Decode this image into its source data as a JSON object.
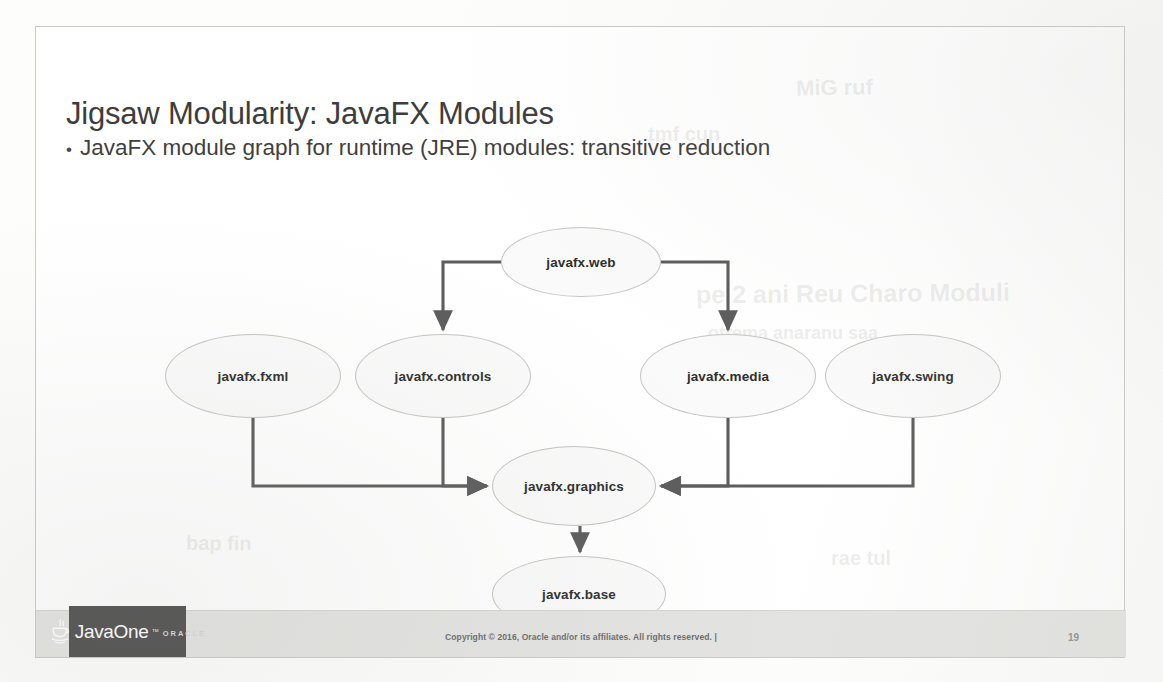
{
  "slide": {
    "title": "Jigsaw Modularity: JavaFX Modules",
    "bullet": {
      "marker": "•",
      "text": "JavaFX module graph for runtime (JRE) modules: transitive reduction"
    }
  },
  "footer": {
    "logo_wordmark": "JavaOne",
    "logo_trademark": "™",
    "logo_sub": "ORACLE",
    "copyright": "Copyright © 2016, Oracle and/or its affiliates. All rights reserved.  |",
    "page_number": "19"
  },
  "colors": {
    "slide_border": "#c9c9c6",
    "title_text": "#3d3d3d",
    "body_text": "#3f3f3f",
    "node_fill": "#fafafa",
    "node_stroke": "#c4c4c0",
    "edge": "#5c5c5c",
    "footer_band": "#e3e3e1",
    "logo_box": "#4e4e4e"
  },
  "chart_data": {
    "type": "diagram",
    "title": "JavaFX module graph for runtime (JRE) modules: transitive reduction",
    "layout": "top-down directed acyclic graph, orthogonal elbow connectors",
    "nodes": [
      {
        "id": "javafx.web",
        "label": "javafx.web",
        "cx": 545,
        "cy": 235,
        "rx": 80,
        "ry": 35,
        "row": 0
      },
      {
        "id": "javafx.fxml",
        "label": "javafx.fxml",
        "cx": 217,
        "cy": 349,
        "rx": 88,
        "ry": 42,
        "row": 1
      },
      {
        "id": "javafx.controls",
        "label": "javafx.controls",
        "cx": 407,
        "cy": 349,
        "rx": 88,
        "ry": 42,
        "row": 1
      },
      {
        "id": "javafx.media",
        "label": "javafx.media",
        "cx": 692,
        "cy": 349,
        "rx": 88,
        "ry": 42,
        "row": 1
      },
      {
        "id": "javafx.swing",
        "label": "javafx.swing",
        "cx": 877,
        "cy": 349,
        "rx": 88,
        "ry": 42,
        "row": 1
      },
      {
        "id": "javafx.graphics",
        "label": "javafx.graphics",
        "cx": 538,
        "cy": 459,
        "rx": 82,
        "ry": 40,
        "row": 2
      },
      {
        "id": "javafx.base",
        "label": "javafx.base",
        "cx": 543,
        "cy": 567,
        "rx": 87,
        "ry": 38,
        "row": 3
      }
    ],
    "edges": [
      {
        "from": "javafx.web",
        "to": "javafx.controls",
        "style": "elbow"
      },
      {
        "from": "javafx.web",
        "to": "javafx.media",
        "style": "elbow"
      },
      {
        "from": "javafx.fxml",
        "to": "javafx.graphics",
        "style": "elbow"
      },
      {
        "from": "javafx.controls",
        "to": "javafx.graphics",
        "style": "elbow"
      },
      {
        "from": "javafx.media",
        "to": "javafx.graphics",
        "style": "elbow"
      },
      {
        "from": "javafx.swing",
        "to": "javafx.graphics",
        "style": "elbow"
      },
      {
        "from": "javafx.graphics",
        "to": "javafx.base",
        "style": "straight"
      }
    ]
  },
  "ghosts": [
    {
      "text": "MiG ruf",
      "x": 760,
      "y": 48,
      "size": 22,
      "rot": -1
    },
    {
      "text": "tmf cun",
      "x": 612,
      "y": 96,
      "size": 20,
      "rot": 0
    },
    {
      "text": "pe 2 ani Reu Charo Moduli",
      "x": 660,
      "y": 252,
      "size": 25,
      "rot": -0.5
    },
    {
      "text": "otrema anaranu saa",
      "x": 672,
      "y": 296,
      "size": 18,
      "rot": 0
    },
    {
      "text": "bap fin",
      "x": 150,
      "y": 505,
      "size": 20,
      "rot": 0.6
    },
    {
      "text": "rae tul",
      "x": 795,
      "y": 520,
      "size": 20,
      "rot": 0
    }
  ]
}
